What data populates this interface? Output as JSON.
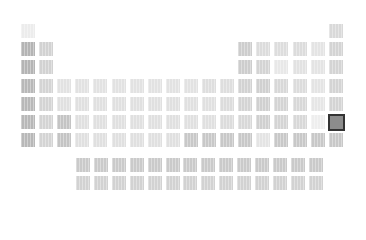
{
  "selected_element": {
    "period": 6,
    "group": 18
  },
  "colors": {
    "selected_border": "#333333",
    "selected_fill": "#8c8c8c"
  },
  "cells": [
    {
      "p": 1,
      "g": 1,
      "shade": "#ececec"
    },
    {
      "p": 1,
      "g": 18,
      "shade": "#d9d9d9"
    },
    {
      "p": 2,
      "g": 1,
      "shade": "#b4b4b4"
    },
    {
      "p": 2,
      "g": 2,
      "shade": "#d2d2d2"
    },
    {
      "p": 2,
      "g": 13,
      "shade": "#cdcdcd"
    },
    {
      "p": 2,
      "g": 14,
      "shade": "#dcdcdc"
    },
    {
      "p": 2,
      "g": 15,
      "shade": "#dddddd"
    },
    {
      "p": 2,
      "g": 16,
      "shade": "#dcdcdc"
    },
    {
      "p": 2,
      "g": 17,
      "shade": "#e4e4e4"
    },
    {
      "p": 2,
      "g": 18,
      "shade": "#d4d4d4"
    },
    {
      "p": 3,
      "g": 1,
      "shade": "#b4b4b4"
    },
    {
      "p": 3,
      "g": 2,
      "shade": "#d2d2d2"
    },
    {
      "p": 3,
      "g": 13,
      "shade": "#cdcdcd"
    },
    {
      "p": 3,
      "g": 14,
      "shade": "#d4d4d4"
    },
    {
      "p": 3,
      "g": 15,
      "shade": "#e8e8e8"
    },
    {
      "p": 3,
      "g": 16,
      "shade": "#e2e2e2"
    },
    {
      "p": 3,
      "g": 17,
      "shade": "#e4e4e4"
    },
    {
      "p": 3,
      "g": 18,
      "shade": "#d4d4d4"
    },
    {
      "p": 4,
      "g": 1,
      "shade": "#b8b8b8"
    },
    {
      "p": 4,
      "g": 2,
      "shade": "#d4d4d4"
    },
    {
      "p": 4,
      "g": 3,
      "shade": "#e2e2e2"
    },
    {
      "p": 4,
      "g": 4,
      "shade": "#e2e2e2"
    },
    {
      "p": 4,
      "g": 5,
      "shade": "#e2e2e2"
    },
    {
      "p": 4,
      "g": 6,
      "shade": "#e2e2e2"
    },
    {
      "p": 4,
      "g": 7,
      "shade": "#e2e2e2"
    },
    {
      "p": 4,
      "g": 8,
      "shade": "#e2e2e2"
    },
    {
      "p": 4,
      "g": 9,
      "shade": "#e2e2e2"
    },
    {
      "p": 4,
      "g": 10,
      "shade": "#e2e2e2"
    },
    {
      "p": 4,
      "g": 11,
      "shade": "#dedede"
    },
    {
      "p": 4,
      "g": 12,
      "shade": "#dedede"
    },
    {
      "p": 4,
      "g": 13,
      "shade": "#d2d2d2"
    },
    {
      "p": 4,
      "g": 14,
      "shade": "#d0d0d0"
    },
    {
      "p": 4,
      "g": 15,
      "shade": "#d8d8d8"
    },
    {
      "p": 4,
      "g": 16,
      "shade": "#dcdcdc"
    },
    {
      "p": 4,
      "g": 17,
      "shade": "#e4e4e4"
    },
    {
      "p": 4,
      "g": 18,
      "shade": "#d4d4d4"
    },
    {
      "p": 5,
      "g": 1,
      "shade": "#b8b8b8"
    },
    {
      "p": 5,
      "g": 2,
      "shade": "#d4d4d4"
    },
    {
      "p": 5,
      "g": 3,
      "shade": "#e0e0e0"
    },
    {
      "p": 5,
      "g": 4,
      "shade": "#e0e0e0"
    },
    {
      "p": 5,
      "g": 5,
      "shade": "#e0e0e0"
    },
    {
      "p": 5,
      "g": 6,
      "shade": "#e0e0e0"
    },
    {
      "p": 5,
      "g": 7,
      "shade": "#e0e0e0"
    },
    {
      "p": 5,
      "g": 8,
      "shade": "#e0e0e0"
    },
    {
      "p": 5,
      "g": 9,
      "shade": "#e0e0e0"
    },
    {
      "p": 5,
      "g": 10,
      "shade": "#e0e0e0"
    },
    {
      "p": 5,
      "g": 11,
      "shade": "#e0e0e0"
    },
    {
      "p": 5,
      "g": 12,
      "shade": "#dcdcdc"
    },
    {
      "p": 5,
      "g": 13,
      "shade": "#d4d4d4"
    },
    {
      "p": 5,
      "g": 14,
      "shade": "#d0d0d0"
    },
    {
      "p": 5,
      "g": 15,
      "shade": "#d4d4d4"
    },
    {
      "p": 5,
      "g": 16,
      "shade": "#d8d8d8"
    },
    {
      "p": 5,
      "g": 17,
      "shade": "#e6e6e6"
    },
    {
      "p": 5,
      "g": 18,
      "shade": "#d4d4d4"
    },
    {
      "p": 6,
      "g": 1,
      "shade": "#b8b8b8"
    },
    {
      "p": 6,
      "g": 2,
      "shade": "#d4d4d4"
    },
    {
      "p": 6,
      "g": 3,
      "shade": "#c4c4c4"
    },
    {
      "p": 6,
      "g": 4,
      "shade": "#e0e0e0"
    },
    {
      "p": 6,
      "g": 5,
      "shade": "#e0e0e0"
    },
    {
      "p": 6,
      "g": 6,
      "shade": "#e0e0e0"
    },
    {
      "p": 6,
      "g": 7,
      "shade": "#e0e0e0"
    },
    {
      "p": 6,
      "g": 8,
      "shade": "#e0e0e0"
    },
    {
      "p": 6,
      "g": 9,
      "shade": "#e0e0e0"
    },
    {
      "p": 6,
      "g": 10,
      "shade": "#e0e0e0"
    },
    {
      "p": 6,
      "g": 11,
      "shade": "#e0e0e0"
    },
    {
      "p": 6,
      "g": 12,
      "shade": "#dcdcdc"
    },
    {
      "p": 6,
      "g": 13,
      "shade": "#d8d8d8"
    },
    {
      "p": 6,
      "g": 14,
      "shade": "#d0d0d0"
    },
    {
      "p": 6,
      "g": 15,
      "shade": "#d4d4d4"
    },
    {
      "p": 6,
      "g": 16,
      "shade": "#d8d8d8"
    },
    {
      "p": 6,
      "g": 17,
      "shade": "#eeeeee"
    },
    {
      "p": 6,
      "g": 18,
      "shade": "#8c8c8c",
      "selected": true
    },
    {
      "p": 7,
      "g": 1,
      "shade": "#b8b8b8"
    },
    {
      "p": 7,
      "g": 2,
      "shade": "#d4d4d4"
    },
    {
      "p": 7,
      "g": 3,
      "shade": "#c4c4c4"
    },
    {
      "p": 7,
      "g": 4,
      "shade": "#e0e0e0"
    },
    {
      "p": 7,
      "g": 5,
      "shade": "#e0e0e0"
    },
    {
      "p": 7,
      "g": 6,
      "shade": "#e0e0e0"
    },
    {
      "p": 7,
      "g": 7,
      "shade": "#e0e0e0"
    },
    {
      "p": 7,
      "g": 8,
      "shade": "#e0e0e0"
    },
    {
      "p": 7,
      "g": 9,
      "shade": "#e0e0e0"
    },
    {
      "p": 7,
      "g": 10,
      "shade": "#c8c8c8"
    },
    {
      "p": 7,
      "g": 11,
      "shade": "#c8c8c8"
    },
    {
      "p": 7,
      "g": 12,
      "shade": "#c8c8c8"
    },
    {
      "p": 7,
      "g": 13,
      "shade": "#c8c8c8"
    },
    {
      "p": 7,
      "g": 14,
      "shade": "#e4e4e4"
    },
    {
      "p": 7,
      "g": 15,
      "shade": "#c8c8c8"
    },
    {
      "p": 7,
      "g": 16,
      "shade": "#c8c8c8"
    },
    {
      "p": 7,
      "g": 17,
      "shade": "#c8c8c8"
    },
    {
      "p": 7,
      "g": 18,
      "shade": "#c8c8c8"
    }
  ],
  "f_block": [
    {
      "row": 0,
      "shades": [
        "#cacaca",
        "#cacaca",
        "#cacaca",
        "#cacaca",
        "#cacaca",
        "#cacaca",
        "#cacaca",
        "#cacaca",
        "#cacaca",
        "#cacaca",
        "#cacaca",
        "#cacaca",
        "#cacaca",
        "#cacaca"
      ]
    },
    {
      "row": 1,
      "shades": [
        "#d2d2d2",
        "#d2d2d2",
        "#d2d2d2",
        "#d2d2d2",
        "#d2d2d2",
        "#d2d2d2",
        "#d2d2d2",
        "#d2d2d2",
        "#d2d2d2",
        "#d2d2d2",
        "#d2d2d2",
        "#d2d2d2",
        "#d2d2d2",
        "#d2d2d2"
      ]
    }
  ]
}
